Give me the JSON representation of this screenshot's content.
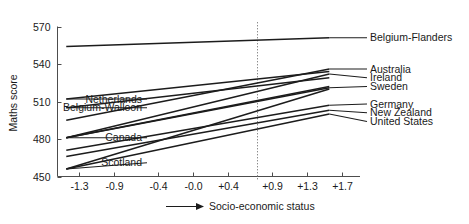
{
  "chart_data": {
    "type": "line",
    "title": "",
    "xlabel": "Socio-economic status",
    "ylabel": "Maths score",
    "xlim": [
      -1.55,
      1.9
    ],
    "ylim": [
      450,
      570
    ],
    "grid": false,
    "legend_position": "inline-end-labels",
    "x_ticks": [
      "-1.3",
      "-0.9",
      "-0.4",
      "-0.0",
      "+0.4",
      "+0.9",
      "+1.3",
      "+1.7"
    ],
    "x_tick_values": [
      -1.3,
      -0.9,
      -0.4,
      0.0,
      0.4,
      0.9,
      1.3,
      1.7
    ],
    "y_ticks": [
      "570",
      "540",
      "510",
      "480",
      "450"
    ],
    "y_tick_values": [
      570,
      540,
      510,
      480,
      450
    ],
    "annotations": [
      {
        "name": "zero-reference-line",
        "x": 0.0,
        "style": "dotted-vertical"
      },
      {
        "name": "x-axis-arrow",
        "label": "Socio-economic status"
      }
    ],
    "series": [
      {
        "name": "Belgium-Flanders",
        "label_side": "right",
        "x": [
          -1.45,
          1.55
        ],
        "values": [
          554,
          561
        ]
      },
      {
        "name": "Australia",
        "label_side": "right",
        "x": [
          -1.45,
          1.55
        ],
        "values": [
          495,
          536
        ]
      },
      {
        "name": "Ireland",
        "label_side": "right",
        "x": [
          -1.45,
          1.55
        ],
        "values": [
          481,
          532
        ]
      },
      {
        "name": "Sweden",
        "label_side": "right",
        "x": [
          -1.45,
          1.55
        ],
        "values": [
          481,
          521
        ]
      },
      {
        "name": "Germany",
        "label_side": "right",
        "x": [
          -1.45,
          1.55
        ],
        "values": [
          471,
          507
        ]
      },
      {
        "name": "New Zealand",
        "label_side": "right",
        "x": [
          -1.45,
          1.55
        ],
        "values": [
          466,
          503
        ]
      },
      {
        "name": "United States",
        "label_side": "right",
        "x": [
          -1.45,
          1.55
        ],
        "values": [
          456,
          500
        ]
      },
      {
        "name": "Netherlands",
        "label_side": "left",
        "x": [
          -1.45,
          1.55
        ],
        "values": [
          512,
          534
        ]
      },
      {
        "name": "Belgium-Walloon",
        "label_side": "left",
        "x": [
          -1.45,
          1.55
        ],
        "values": [
          505,
          529
        ]
      },
      {
        "name": "Canada",
        "label_side": "left",
        "x": [
          -1.45,
          1.55
        ],
        "values": [
          481,
          522
        ]
      },
      {
        "name": "Scotland",
        "label_side": "left",
        "x": [
          -1.45,
          1.55
        ],
        "values": [
          456,
          520
        ]
      }
    ],
    "left_labels": [
      {
        "text": "Netherlands",
        "y": 512
      },
      {
        "text": "Belgium-Walloon",
        "y": 505
      },
      {
        "text": "Canada",
        "y": 481
      },
      {
        "text": "Scotland",
        "y": 461
      }
    ],
    "right_labels": [
      {
        "text": "Belgium-Flanders",
        "y": 561
      },
      {
        "text": "Australia",
        "y": 536
      },
      {
        "text": "Ireland",
        "y": 529
      },
      {
        "text": "Sweden",
        "y": 522
      },
      {
        "text": "Germany",
        "y": 508
      },
      {
        "text": "New Zealand",
        "y": 501
      },
      {
        "text": "United States",
        "y": 494
      }
    ]
  }
}
